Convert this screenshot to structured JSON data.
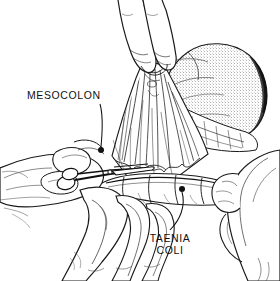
{
  "figure": {
    "medium": "pen-and-ink line drawing",
    "width": 280,
    "height": 281,
    "background_color": "#ffffff",
    "ink_color": "#111111"
  },
  "labels": {
    "mesocolon": {
      "text": "MESOCOLON",
      "leader_dot_label": "mesocolon-pointer-dot"
    },
    "taenia": {
      "line1": "TAENIA",
      "line2": "COLI",
      "leader_dot_label": "taenia-coli-pointer-dot"
    }
  },
  "anatomy": {
    "stomach_label": "stomach",
    "mesocolon_label": "mesocolon fan",
    "colon_label": "transverse colon with haustra",
    "omentum_label": "greater omentum"
  },
  "instruments": {
    "scissors_label": "surgical scissors",
    "forceps_label": "tissue forceps"
  },
  "hands": {
    "upper_label": "assistant hand retracting omentum",
    "left_label": "surgeon left hand",
    "right_label": "assistant hand at right",
    "lower_label": "surgeon hand supporting colon"
  }
}
